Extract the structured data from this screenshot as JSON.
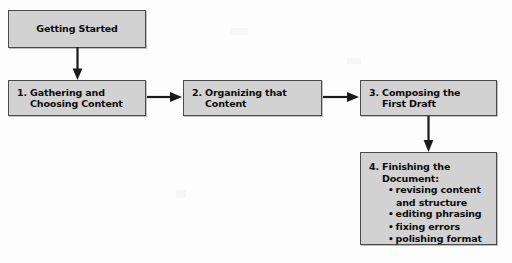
{
  "diagram": {
    "background_color": "#fdfdfd",
    "box_fill_color": "#d2d2d2",
    "box_border_color": "#4a4a4a",
    "text_color": "#0c0c0c",
    "arrow_color": "#1a1a1a"
  },
  "nodes": {
    "getting_started": {
      "label": "Getting Started"
    },
    "step1": {
      "label": "1. Gathering and Choosing Content",
      "line1": "1. Gathering and",
      "line2": "Choosing Content"
    },
    "step2": {
      "label": "2. Organizing that Content",
      "line1": "2. Organizing that",
      "line2": "Content"
    },
    "step3": {
      "label": "3. Composing the First Draft",
      "line1": "3. Composing the",
      "line2": "First Draft"
    },
    "step4": {
      "label": "4. Finishing the Document:",
      "line1": "4. Finishing the",
      "line2": "Document:",
      "bullets": [
        "revising content and structure",
        "editing phrasing",
        "fixing errors",
        "polishing format"
      ],
      "bullet_glyph": "•"
    }
  },
  "connectors": [
    {
      "name": "getting-started-to-step1",
      "direction": "down"
    },
    {
      "name": "step1-to-step2",
      "direction": "right"
    },
    {
      "name": "step2-to-step3",
      "direction": "right"
    },
    {
      "name": "step3-to-step4",
      "direction": "down"
    }
  ]
}
